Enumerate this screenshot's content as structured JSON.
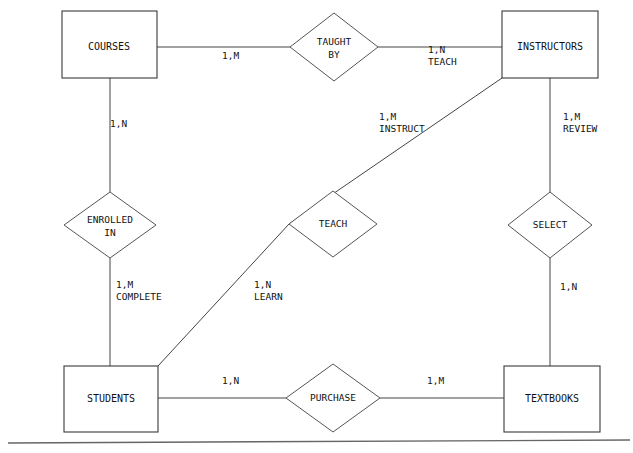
{
  "diagram": {
    "type": "entity-relationship",
    "notation": "Chen",
    "stroke_color": "#333333",
    "text_color": "#111111",
    "background_color": "#ffffff",
    "entities": [
      {
        "id": "courses",
        "label": "COURSES",
        "x": 62,
        "y": 11,
        "w": 95,
        "h": 67
      },
      {
        "id": "instructors",
        "label": "INSTRUCTORS",
        "x": 502,
        "y": 11,
        "w": 96,
        "h": 67
      },
      {
        "id": "students",
        "label": "STUDENTS",
        "x": 64,
        "y": 366,
        "w": 94,
        "h": 66
      },
      {
        "id": "textbooks",
        "label": "TEXTBOOKS",
        "x": 504,
        "y": 366,
        "w": 96,
        "h": 66
      }
    ],
    "relationships": [
      {
        "id": "taught-by",
        "label_line1": "TAUGHT",
        "label_line2": "BY",
        "cx": 334,
        "cy": 47,
        "rx": 44,
        "ry": 34
      },
      {
        "id": "enrolled-in",
        "label_line1": "ENROLLED",
        "label_line2": "IN",
        "cx": 110,
        "cy": 225,
        "rx": 46,
        "ry": 33
      },
      {
        "id": "teach",
        "label_line1": "TEACH",
        "label_line2": "",
        "cx": 333,
        "cy": 224,
        "rx": 44,
        "ry": 33
      },
      {
        "id": "select",
        "label_line1": "SELECT",
        "label_line2": "",
        "cx": 550,
        "cy": 225,
        "rx": 42,
        "ry": 33
      },
      {
        "id": "purchase",
        "label_line1": "PURCHASE",
        "label_line2": "",
        "cx": 333,
        "cy": 398,
        "rx": 47,
        "ry": 34
      }
    ],
    "cardinality_labels": [
      {
        "id": "courses-taughtby",
        "line1": "1,M",
        "line2": "",
        "x": 222,
        "y": 50
      },
      {
        "id": "taughtby-instructors",
        "line1": "1,N",
        "line2": "TEACH",
        "x": 428,
        "y": 50
      },
      {
        "id": "courses-enrolledin",
        "line1": "1,N",
        "line2": "",
        "x": 110,
        "y": 124
      },
      {
        "id": "instructors-instruct",
        "line1": "1,M",
        "line2": "INSTRUCT",
        "x": 379,
        "y": 116
      },
      {
        "id": "instructors-review",
        "line1": "1,M",
        "line2": "REVIEW",
        "x": 563,
        "y": 117
      },
      {
        "id": "enrolledin-complete",
        "line1": "1,M",
        "line2": "COMPLETE",
        "x": 116,
        "y": 285
      },
      {
        "id": "students-learn",
        "line1": "1,N",
        "line2": "LEARN",
        "x": 254,
        "y": 285
      },
      {
        "id": "select-textbooks",
        "line1": "1,N",
        "line2": "",
        "x": 560,
        "y": 287
      },
      {
        "id": "students-purchase",
        "line1": "1,N",
        "line2": "",
        "x": 222,
        "y": 381
      },
      {
        "id": "purchase-textbooks",
        "line1": "1,M",
        "line2": "",
        "x": 427,
        "y": 381
      }
    ],
    "connectors": [
      {
        "id": "courses-to-taughtby",
        "points": "157,47 290,47"
      },
      {
        "id": "taughtby-to-instructors",
        "points": "378,47 502,47"
      },
      {
        "id": "courses-to-enrolledin",
        "points": "110,78 110,192"
      },
      {
        "id": "enrolledin-to-students",
        "points": "110,258 110,366"
      },
      {
        "id": "instructors-to-teach",
        "points": "502,78 289,224"
      },
      {
        "id": "teach-to-students",
        "points": "289,224 158,366"
      },
      {
        "id": "instructors-to-select",
        "points": "550,78 550,192"
      },
      {
        "id": "select-to-textbooks",
        "points": "550,258 550,366"
      },
      {
        "id": "students-to-purchase",
        "points": "158,398 286,398"
      },
      {
        "id": "purchase-to-textbooks",
        "points": "380,398 504,398"
      }
    ],
    "frame": {
      "id": "bottom-rule",
      "x1": 8,
      "y1": 443,
      "x2": 630,
      "y2": 440
    }
  }
}
